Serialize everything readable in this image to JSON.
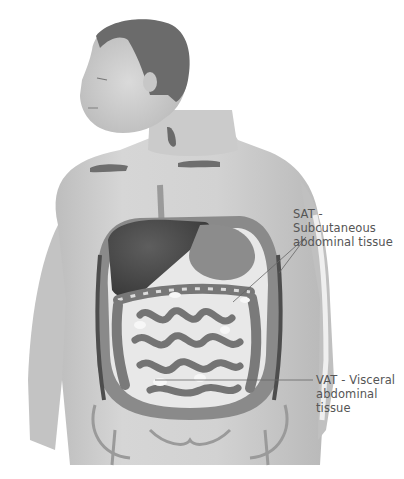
{
  "figure": {
    "colors": {
      "background": "#ffffff",
      "skin": "#cfcfcf",
      "skin_shadow": "#a9a9a9",
      "hair": "#6a6a6a",
      "organ_dark": "#4a4a4a",
      "intestine": "#7d7d7d",
      "fat": "#f2f2f2",
      "label_text": "#555555",
      "leader_line": "#666666"
    }
  },
  "labels": {
    "sat": {
      "line1": "SAT - Subcutaneous",
      "line2": "abdominal tissue"
    },
    "vat": {
      "line1": "VAT - Visceral",
      "line2": "abdominal",
      "line3": "tissue"
    }
  }
}
